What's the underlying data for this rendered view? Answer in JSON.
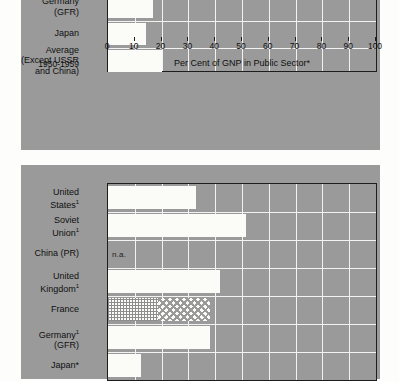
{
  "figure": {
    "axis_title": "Per Cent of GNP in Public Sector*",
    "period_label": "1950-1959",
    "na_label": "n.a."
  },
  "chart_data": [
    {
      "type": "bar",
      "orientation": "horizontal",
      "title": "",
      "xlabel": "Per Cent of GNP in Public Sector*",
      "ylabel": "",
      "xlim": [
        0,
        100
      ],
      "xticks": [
        0,
        10,
        20,
        30,
        40,
        50,
        60,
        70,
        80,
        90,
        100
      ],
      "xtick_labels": [
        "0",
        "10",
        "20",
        "30",
        "40",
        "50",
        "60",
        "70",
        "80",
        "90",
        "100"
      ],
      "grid": true,
      "legend": "none",
      "annotation": "1950-1959",
      "categories": [
        "France",
        "Germany (GFR)",
        "Japan",
        "Average (Except USSR and China)"
      ],
      "values": [
        26.5,
        16.8,
        14.0,
        20.0
      ]
    },
    {
      "type": "bar",
      "orientation": "horizontal",
      "title": "",
      "xlabel": "",
      "ylabel": "",
      "xlim": [
        0,
        100
      ],
      "xticks": [
        0,
        10,
        20,
        30,
        40,
        50,
        60,
        70,
        80,
        90,
        100
      ],
      "grid": true,
      "legend": "none",
      "categories": [
        "United States¹",
        "Soviet Union¹",
        "China (PR)",
        "United Kingdom¹",
        "France",
        "Germany¹ (GFR)",
        "Japan*"
      ],
      "values": [
        33.0,
        51.5,
        null,
        41.8,
        38.0,
        38.0,
        12.3
      ],
      "notes": [
        "China (PR) value is n.a.",
        "France bar is drawn in two hatched segments: 0-18.7 cross-hatch, 18.7-38.0 checker"
      ]
    }
  ],
  "top_chart": {
    "rows": [
      {
        "name": "france",
        "label_lines": [
          "France"
        ],
        "value": 26.5
      },
      {
        "name": "germany",
        "label_lines": [
          "Germany",
          "(GFR)"
        ],
        "value": 16.8
      },
      {
        "name": "japan",
        "label_lines": [
          "Japan"
        ],
        "value": 14.0
      },
      {
        "name": "average",
        "label_lines": [
          "Average",
          "(Except USSR",
          "and China)"
        ],
        "value": 20.0
      }
    ]
  },
  "bottom_chart": {
    "rows": [
      {
        "name": "united-states",
        "label_lines": [
          "United",
          "States¹"
        ],
        "value": 33.0
      },
      {
        "name": "soviet-union",
        "label_lines": [
          "Soviet",
          "Union¹"
        ],
        "value": 51.5
      },
      {
        "name": "china-pr",
        "label_lines": [
          "China (PR)"
        ],
        "value": null
      },
      {
        "name": "united-kingdom",
        "label_lines": [
          "United",
          "Kingdom¹"
        ],
        "value": 41.8
      },
      {
        "name": "france",
        "label_lines": [
          "France"
        ],
        "value": 38.0,
        "segments": [
          18.7,
          38.0
        ]
      },
      {
        "name": "germany",
        "label_lines": [
          "Germany¹",
          "(GFR)"
        ],
        "value": 38.0
      },
      {
        "name": "japan",
        "label_lines": [
          "Japan*"
        ],
        "value": 12.3
      }
    ]
  },
  "colors": {
    "panel": "#9a9a9a",
    "bar": "#fbfbf7",
    "gridline": "#f2f2f2",
    "axis": "#1d1d1d",
    "page": "#fdfdfb"
  }
}
